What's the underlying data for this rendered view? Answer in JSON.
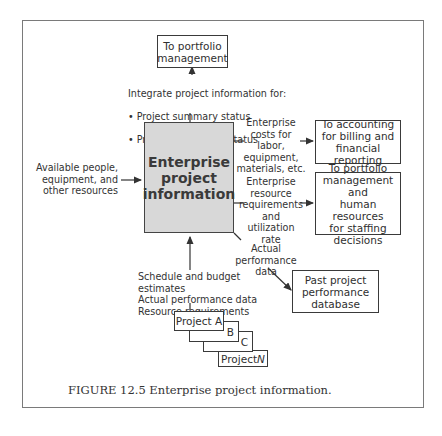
{
  "central": {
    "title": "Enterprise\nproject\ninformation",
    "fill": "#d8d8d8"
  },
  "top_box": {
    "label": "To portfolio\nmanagement"
  },
  "integrate_label": {
    "heading": "Integrate project information for:",
    "bullets": [
      "Project summary status",
      "Program summary status"
    ]
  },
  "left_input": {
    "label": "Available people,\nequipment, and\nother resources"
  },
  "right_outputs": [
    {
      "flow_label": "Enterprise\ncosts for labor,\nequipment,\nmaterials, etc.",
      "box_label": "To accounting\nfor billing and\nfinancial reporting"
    },
    {
      "flow_label": "Enterprise\nresource\nrequirements\nand utilization\nrate",
      "box_label": "To portfolio\nmanagement and\nhuman resources\nfor staffing\ndecisions"
    }
  ],
  "past_db": {
    "flow_label": "Actual\nperformance data",
    "box_label": "Past project\nperformance\ndatabase"
  },
  "bottom_input": {
    "label": "Schedule and budget estimates\nActual performance data\nResource requirements"
  },
  "projects": {
    "a": "Project A",
    "b": "B",
    "c": "C",
    "n_prefix": "Project ",
    "n_letter": "N"
  },
  "caption": "FIGURE 12.5  Enterprise project information."
}
